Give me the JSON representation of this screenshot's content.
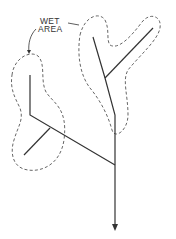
{
  "diagram": {
    "label_line1": "WET",
    "label_line2": "AREA",
    "elements": {
      "drainage_network": "solid branching drain lines",
      "wet_areas": "dashed outlines surrounding branch lines",
      "outlet": "arrow pointing down"
    }
  }
}
